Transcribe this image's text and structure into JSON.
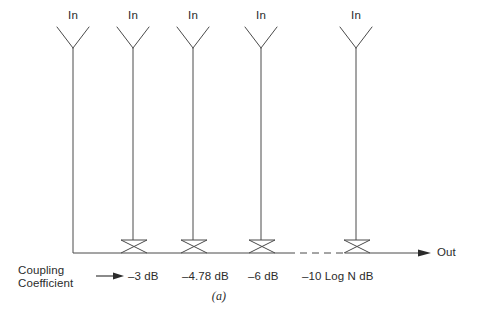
{
  "figure": {
    "caption": "(a)",
    "line_color": "#4a4a4a",
    "text_color": "#2b2b2b",
    "background": "#ffffff"
  },
  "inputs": [
    {
      "label": "In",
      "x": 73
    },
    {
      "label": "In",
      "x": 133
    },
    {
      "label": "In",
      "x": 193
    },
    {
      "label": "In",
      "x": 261
    },
    {
      "label": "In",
      "x": 356
    }
  ],
  "output": {
    "label": "Out",
    "arrow": "solid-right-arrowhead"
  },
  "bus": {
    "y": 253,
    "start_x": 73,
    "end_x": 430,
    "dashed_segment": {
      "from_x": 288,
      "to_x": 345
    }
  },
  "couplers": [
    {
      "x": 133,
      "type": "directional-coupler"
    },
    {
      "x": 193,
      "type": "directional-coupler"
    },
    {
      "x": 261,
      "type": "directional-coupler"
    },
    {
      "x": 356,
      "type": "directional-coupler"
    }
  ],
  "coupling_coefficient": {
    "title_line1": "Coupling",
    "title_line2": "Coefficient",
    "arrow": "solid-right-arrowhead",
    "values": [
      {
        "text": "–3 dB",
        "x": 131
      },
      {
        "text": "–4.78 dB",
        "x": 183
      },
      {
        "text": "–6 dB",
        "x": 249
      },
      {
        "text": "–10 Log N dB",
        "x": 303
      }
    ]
  }
}
